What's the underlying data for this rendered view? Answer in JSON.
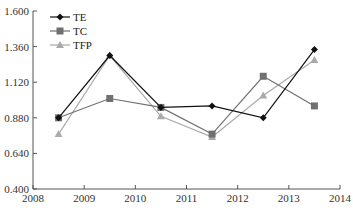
{
  "chart_data": {
    "type": "line",
    "title": "",
    "xlabel": "",
    "ylabel": "",
    "x": [
      2008.5,
      2009.5,
      2010.5,
      2011.5,
      2012.5,
      2013.5
    ],
    "xlim": [
      2008,
      2014
    ],
    "ylim": [
      0.4,
      1.6
    ],
    "x_ticks": [
      "2008",
      "2009",
      "2010",
      "2011",
      "2012",
      "2013",
      "2014"
    ],
    "y_ticks": [
      "0.400",
      "0.640",
      "0.880",
      "1.120",
      "1.360",
      "1.600"
    ],
    "grid": false,
    "legend_position": "top-left",
    "series": [
      {
        "name": "TE",
        "marker": "diamond",
        "color": "#111111",
        "values": [
          0.88,
          1.3,
          0.95,
          0.96,
          0.88,
          1.34
        ]
      },
      {
        "name": "TC",
        "marker": "square",
        "color": "#707070",
        "values": [
          0.88,
          1.01,
          0.95,
          0.77,
          1.16,
          0.96
        ]
      },
      {
        "name": "TFP",
        "marker": "triangle",
        "color": "#aaaaaa",
        "values": [
          0.77,
          1.3,
          0.89,
          0.75,
          1.03,
          1.27
        ]
      }
    ]
  },
  "legend": {
    "items": [
      {
        "label": "TE"
      },
      {
        "label": "TC"
      },
      {
        "label": "TFP"
      }
    ]
  }
}
